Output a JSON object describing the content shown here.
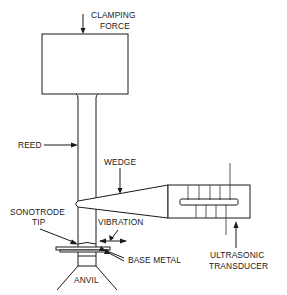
{
  "diagram": {
    "type": "ultrasonic-welding-schematic",
    "labels": {
      "clamping_force_line1": "CLAMPING",
      "clamping_force_line2": "FORCE",
      "reed": "REED",
      "wedge": "WEDGE",
      "sonotrode_tip_line1": "SONOTRODE",
      "sonotrode_tip_line2": "TIP",
      "vibration": "VIBRATION",
      "base_metal": "BASE METAL",
      "anvil": "ANVIL",
      "ultrasonic_transducer_line1": "ULTRASONIC",
      "ultrasonic_transducer_line2": "TRANSDUCER"
    },
    "components": [
      "clamping mass",
      "reed",
      "wedge",
      "ultrasonic transducer",
      "sonotrode tip",
      "base metal",
      "anvil"
    ]
  }
}
